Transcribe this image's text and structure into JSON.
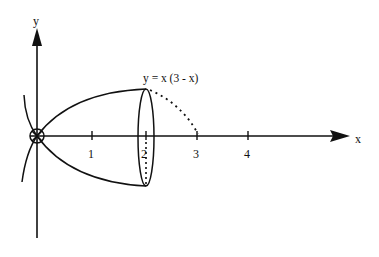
{
  "diagram": {
    "type": "solid-of-revolution",
    "x_axis_label": "x",
    "y_axis_label": "y",
    "curve_label": "y = x (3 - x)",
    "ticks": [
      {
        "value": 1,
        "label": "1"
      },
      {
        "value": 2,
        "label": "2"
      },
      {
        "value": 3,
        "label": "3"
      },
      {
        "value": 4,
        "label": "4"
      }
    ],
    "colors": {
      "stroke": "#111111",
      "background": "#ffffff"
    }
  }
}
